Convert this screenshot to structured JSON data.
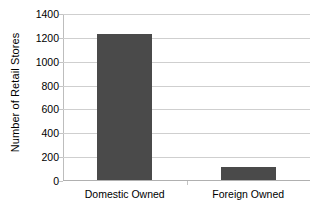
{
  "chart_data": {
    "type": "bar",
    "title": "",
    "subtitle": "",
    "xlabel": "",
    "ylabel": "Number of Retail Stores",
    "categories": [
      "Domestic Owned",
      "Foreign Owned"
    ],
    "values": [
      1225,
      110
    ],
    "ylim": [
      0,
      1400
    ],
    "ytick_labels": [
      "1400",
      "1200",
      "1000",
      "800",
      "600",
      "400",
      "200",
      "0"
    ],
    "ytick_values": [
      1400,
      1200,
      1000,
      800,
      600,
      400,
      200,
      0
    ],
    "grid": true,
    "legend": false,
    "legend_position": "none",
    "bar_color": "#4a4a4a",
    "gridline_color": "#cfcfcf",
    "axis_color": "#b0b0b0",
    "background_color": "#ffffff"
  }
}
